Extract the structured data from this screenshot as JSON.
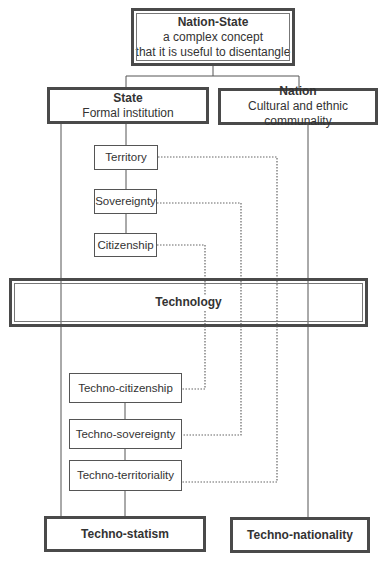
{
  "root": {
    "title": "Nation-State",
    "line1": "a complex concept",
    "line2": "that it is useful to disentangle"
  },
  "state": {
    "title": "State",
    "subtitle": "Formal institution"
  },
  "nation": {
    "title": "Nation",
    "subtitle": "Cultural and ethnic communality"
  },
  "state_elements": [
    {
      "label": "Territory"
    },
    {
      "label": "Sovereignty"
    },
    {
      "label": "Citizenship"
    }
  ],
  "technology": {
    "label": "Technology"
  },
  "techno_elements": [
    {
      "label": "Techno-citizenship"
    },
    {
      "label": "Techno-sovereignty"
    },
    {
      "label": "Techno-territoriality"
    }
  ],
  "outcomes": {
    "statism": "Techno-statism",
    "nationality": "Techno-nationality"
  },
  "colors": {
    "border": "#4a4a4a",
    "line": "#555555",
    "dotted": "#666666"
  }
}
